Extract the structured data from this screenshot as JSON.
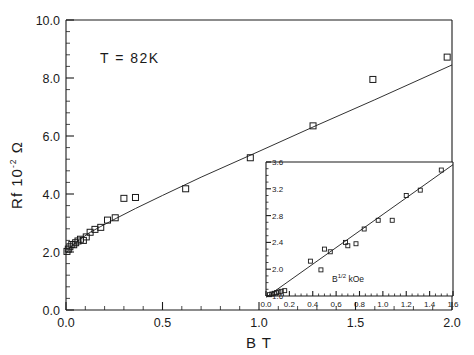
{
  "figure": {
    "background_color": "#ffffff",
    "ink_color": "#1a1a1a"
  },
  "annotations": {
    "temperature_label": "T  =  82K"
  },
  "chart_data": [
    {
      "id": "main",
      "type": "scatter",
      "title": "",
      "subtitle": "",
      "xlabel": "B  T",
      "ylabel": "Rf  10",
      "ylabel_exponent": "-2",
      "ylabel_unit": "Ω",
      "xlim": [
        0.0,
        2.0
      ],
      "ylim": [
        0.0,
        10.0
      ],
      "xticks": [
        0.0,
        0.5,
        1.0,
        1.5,
        2.0
      ],
      "xticklabels": [
        "0.0",
        "0.5",
        "1.0",
        "1.5",
        "2.0"
      ],
      "yticks": [
        0.0,
        2.0,
        4.0,
        6.0,
        8.0,
        10.0
      ],
      "yticklabels": [
        "0.0",
        "2.0",
        "4.0",
        "6.0",
        "8.0",
        "10.0"
      ],
      "x_minor_per_major": 5,
      "y_minor_per_major": 5,
      "grid": false,
      "legend": false,
      "marker": "open-square",
      "annotations": [
        "T  =  82K"
      ],
      "x": [
        0.005,
        0.012,
        0.02,
        0.03,
        0.04,
        0.05,
        0.062,
        0.075,
        0.09,
        0.105,
        0.125,
        0.15,
        0.18,
        0.215,
        0.255,
        0.3,
        0.36,
        0.62,
        0.955,
        1.28,
        1.59,
        1.975
      ],
      "y": [
        2.02,
        2.1,
        2.18,
        2.26,
        2.25,
        2.32,
        2.38,
        2.44,
        2.4,
        2.52,
        2.68,
        2.78,
        2.85,
        3.1,
        3.18,
        3.85,
        3.88,
        4.18,
        5.25,
        6.35,
        7.95,
        8.72
      ],
      "fit_line": {
        "description": "smooth curve through data, steep rise near origin then near-linear",
        "x": [
          0.0,
          0.03,
          0.07,
          0.12,
          0.18,
          0.26,
          0.36,
          0.5,
          0.7,
          1.0,
          1.3,
          1.6,
          2.0
        ],
        "y": [
          1.95,
          2.22,
          2.42,
          2.66,
          2.88,
          3.16,
          3.5,
          3.95,
          4.58,
          5.47,
          6.37,
          7.25,
          8.45
        ]
      }
    },
    {
      "id": "inset",
      "type": "scatter",
      "title": "",
      "xlabel": "B",
      "xlabel_exponent": "1/2",
      "xlabel_unit": "kOe",
      "ylabel": "",
      "xlim": [
        0.0,
        1.6
      ],
      "ylim": [
        1.6,
        3.6
      ],
      "xticks": [
        0.0,
        0.2,
        0.4,
        0.6,
        0.8,
        1.0,
        1.2,
        1.4,
        1.6
      ],
      "xticklabels": [
        "0.0",
        "0.2",
        "0.4",
        "0.6",
        "0.8",
        "1.0",
        "1.2",
        "1.4",
        "1.6"
      ],
      "yticks": [
        1.6,
        2.0,
        2.4,
        2.8,
        3.2,
        3.6
      ],
      "yticklabels": [
        "1.6",
        "2.0",
        "2.4",
        "2.8",
        "3.2",
        "3.6"
      ],
      "x_minor_per_major": 4,
      "y_minor_per_major": 4,
      "grid": false,
      "legend": false,
      "marker": "open-square",
      "x": [
        0.03,
        0.05,
        0.07,
        0.09,
        0.11,
        0.13,
        0.16,
        0.38,
        0.47,
        0.5,
        0.55,
        0.68,
        0.7,
        0.77,
        0.84,
        0.96,
        1.08,
        1.2,
        1.32,
        1.5
      ],
      "y": [
        1.62,
        1.63,
        1.64,
        1.65,
        1.66,
        1.67,
        1.68,
        2.12,
        1.99,
        2.3,
        2.26,
        2.4,
        2.35,
        2.38,
        2.6,
        2.73,
        2.73,
        3.1,
        3.18,
        3.48
      ],
      "fit_line": {
        "description": "straight regression line",
        "x": [
          0.0,
          1.6
        ],
        "y": [
          1.58,
          3.56
        ]
      }
    }
  ]
}
